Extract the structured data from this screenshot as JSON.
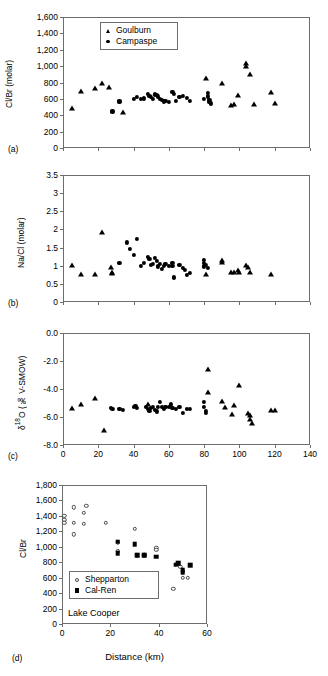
{
  "figure": {
    "width": 328,
    "height": 676,
    "background": "#ffffff",
    "marker_color": "#000000",
    "axis_color": "#6d6d6d"
  },
  "panels": [
    {
      "id": "a",
      "label": "(a)",
      "ylabel": "Cl/Br (molar)",
      "xlabel": "",
      "ylim": [
        0,
        1600
      ],
      "xlim": [
        0,
        140
      ],
      "yticks": [
        "0",
        "200",
        "400",
        "600",
        "800",
        "1,000",
        "1,200",
        "1,400",
        "1,600"
      ],
      "ytick_values": [
        0,
        200,
        400,
        600,
        800,
        1000,
        1200,
        1400,
        1600
      ],
      "xticks": [
        "",
        "",
        "",
        "",
        "",
        "",
        "",
        ""
      ],
      "xtick_values": [
        0,
        20,
        40,
        60,
        80,
        100,
        120,
        140
      ],
      "legend": {
        "position": "top-left",
        "entries": [
          {
            "label": "Goulburn",
            "marker": "triangle-filled"
          },
          {
            "label": "Campaspe",
            "marker": "circle-filled"
          }
        ]
      }
    },
    {
      "id": "b",
      "label": "(b)",
      "ylabel": "Na/Cl (molar)",
      "xlabel": "",
      "ylim": [
        0,
        3.5
      ],
      "xlim": [
        0,
        140
      ],
      "yticks": [
        "0",
        "0.5",
        "1",
        "1.5",
        "2",
        "2.5",
        "3",
        "3.5"
      ],
      "ytick_values": [
        0,
        0.5,
        1,
        1.5,
        2,
        2.5,
        3,
        3.5
      ],
      "xticks": [
        "",
        "",
        "",
        "",
        "",
        "",
        "",
        ""
      ],
      "xtick_values": [
        0,
        20,
        40,
        60,
        80,
        100,
        120,
        140
      ],
      "legend": null
    },
    {
      "id": "c",
      "label": "(c)",
      "ylabel": "δ18O (‰ V-SMOW)",
      "ylabel_parts": {
        "delta": "δ",
        "sup": "18",
        "rest": "O (‰ V-SMOW)"
      },
      "xlabel": "",
      "ylim": [
        -8.0,
        0.0
      ],
      "xlim": [
        0,
        140
      ],
      "yticks": [
        "-8.0",
        "-6.0",
        "-4.0",
        "-2.0",
        "0.0"
      ],
      "ytick_values": [
        -8,
        -6,
        -4,
        -2,
        0
      ],
      "xticks": [
        "0",
        "20",
        "40",
        "60",
        "80",
        "100",
        "120",
        "140"
      ],
      "xtick_values": [
        0,
        20,
        40,
        60,
        80,
        100,
        120,
        140
      ],
      "legend": null
    },
    {
      "id": "d",
      "label": "(d)",
      "ylabel": "Cl/Br",
      "xlabel": "Distance (km)",
      "ylim": [
        0,
        1800
      ],
      "xlim": [
        0,
        60
      ],
      "yticks": [
        "0",
        "200",
        "400",
        "600",
        "800",
        "1,000",
        "1,200",
        "1,400",
        "1,600",
        "1,800"
      ],
      "ytick_values": [
        0,
        200,
        400,
        600,
        800,
        1000,
        1200,
        1400,
        1600,
        1800
      ],
      "xticks": [
        "0",
        "20",
        "40",
        "60"
      ],
      "xtick_values": [
        0,
        20,
        40,
        60
      ],
      "annotation": "Lake Cooper",
      "legend": {
        "position": "lower-left",
        "entries": [
          {
            "label": "Shepparton",
            "marker": "circle-open"
          },
          {
            "label": "Cal-Ren",
            "marker": "square-filled"
          }
        ]
      }
    }
  ],
  "chart_data": [
    {
      "type": "scatter",
      "panel": "a",
      "title": "",
      "xlabel": "",
      "ylabel": "Cl/Br (molar)",
      "xlim": [
        0,
        140
      ],
      "ylim": [
        0,
        1600
      ],
      "grid": false,
      "legend_position": "top-left",
      "series": [
        {
          "name": "Goulburn",
          "marker": "triangle-filled",
          "points": [
            [
              5,
              490
            ],
            [
              10,
              695
            ],
            [
              18,
              730
            ],
            [
              22,
              800
            ],
            [
              26,
              740
            ],
            [
              34,
              435
            ],
            [
              81,
              860
            ],
            [
              90,
              790
            ],
            [
              95,
              520
            ],
            [
              97,
              535
            ],
            [
              99,
              650
            ],
            [
              104,
              1035
            ],
            [
              104,
              1005
            ],
            [
              106,
              905
            ],
            [
              108,
              535
            ],
            [
              118,
              685
            ],
            [
              120,
              555
            ]
          ]
        },
        {
          "name": "Campaspe",
          "marker": "circle-filled",
          "points": [
            [
              28,
              455
            ],
            [
              28,
              440
            ],
            [
              32,
              575
            ],
            [
              32,
              560
            ],
            [
              40,
              600
            ],
            [
              42,
              620
            ],
            [
              44,
              595
            ],
            [
              46,
              605
            ],
            [
              48,
              660
            ],
            [
              49,
              640
            ],
            [
              50,
              620
            ],
            [
              51,
              600
            ],
            [
              52,
              655
            ],
            [
              53,
              645
            ],
            [
              54,
              630
            ],
            [
              55,
              600
            ],
            [
              56,
              590
            ],
            [
              57,
              570
            ],
            [
              58,
              575
            ],
            [
              60,
              560
            ],
            [
              62,
              690
            ],
            [
              63,
              660
            ],
            [
              64,
              580
            ],
            [
              66,
              620
            ],
            [
              68,
              635
            ],
            [
              70,
              610
            ],
            [
              72,
              575
            ],
            [
              80,
              600
            ],
            [
              82,
              670
            ],
            [
              82,
              630
            ],
            [
              83,
              590
            ],
            [
              83,
              560
            ],
            [
              84,
              545
            ]
          ]
        }
      ]
    },
    {
      "type": "scatter",
      "panel": "b",
      "title": "",
      "xlabel": "",
      "ylabel": "Na/Cl (molar)",
      "xlim": [
        0,
        140
      ],
      "ylim": [
        0,
        3.5
      ],
      "grid": false,
      "series": [
        {
          "name": "Goulburn",
          "marker": "triangle-filled",
          "points": [
            [
              5,
              1.02
            ],
            [
              10,
              0.78
            ],
            [
              18,
              0.76
            ],
            [
              22,
              1.94
            ],
            [
              27,
              0.97
            ],
            [
              28,
              0.84
            ],
            [
              28,
              0.79
            ],
            [
              81,
              0.77
            ],
            [
              90,
              1.15
            ],
            [
              90,
              1.11
            ],
            [
              95,
              0.83
            ],
            [
              97,
              0.84
            ],
            [
              99,
              0.87
            ],
            [
              100,
              0.84
            ],
            [
              104,
              1.02
            ],
            [
              105,
              0.97
            ],
            [
              106,
              0.82
            ],
            [
              118,
              0.78
            ]
          ]
        },
        {
          "name": "Campaspe",
          "marker": "circle-filled",
          "points": [
            [
              32,
              1.08
            ],
            [
              36,
              1.64
            ],
            [
              38,
              1.46
            ],
            [
              40,
              1.3
            ],
            [
              42,
              1.75
            ],
            [
              44,
              1.0
            ],
            [
              46,
              1.07
            ],
            [
              48,
              1.25
            ],
            [
              49,
              1.18
            ],
            [
              50,
              1.02
            ],
            [
              51,
              1.06
            ],
            [
              52,
              1.22
            ],
            [
              53,
              1.13
            ],
            [
              54,
              0.98
            ],
            [
              55,
              1.05
            ],
            [
              56,
              0.92
            ],
            [
              57,
              1.0
            ],
            [
              58,
              1.04
            ],
            [
              60,
              0.99
            ],
            [
              62,
              1.08
            ],
            [
              62,
              1.0
            ],
            [
              63,
              0.7
            ],
            [
              63,
              0.66
            ],
            [
              66,
              1.02
            ],
            [
              68,
              0.93
            ],
            [
              69,
              0.88
            ],
            [
              70,
              0.74
            ],
            [
              72,
              0.8
            ],
            [
              80,
              1.17
            ],
            [
              80,
              1.07
            ],
            [
              80,
              0.98
            ],
            [
              81,
              1.02
            ],
            [
              82,
              0.95
            ]
          ]
        }
      ]
    },
    {
      "type": "scatter",
      "panel": "c",
      "title": "",
      "xlabel": "",
      "ylabel": "δ18O (‰ V-SMOW)",
      "xlim": [
        0,
        140
      ],
      "ylim": [
        -8.0,
        0.0
      ],
      "grid": false,
      "series": [
        {
          "name": "Goulburn",
          "marker": "triangle-filled",
          "points": [
            [
              5,
              -5.35
            ],
            [
              10,
              -5.1
            ],
            [
              18,
              -4.65
            ],
            [
              23,
              -6.9
            ],
            [
              48,
              -5.05
            ],
            [
              82,
              -2.6
            ],
            [
              82,
              -4.18
            ],
            [
              90,
              -4.85
            ],
            [
              92,
              -5.3
            ],
            [
              96,
              -5.8
            ],
            [
              97,
              -5.15
            ],
            [
              100,
              -3.7
            ],
            [
              105,
              -5.7
            ],
            [
              106,
              -5.85
            ],
            [
              106,
              -6.15
            ],
            [
              107,
              -6.45
            ],
            [
              118,
              -5.5
            ],
            [
              120,
              -5.5
            ]
          ]
        },
        {
          "name": "Campaspe",
          "marker": "circle-filled",
          "points": [
            [
              27,
              -5.35
            ],
            [
              28,
              -5.4
            ],
            [
              32,
              -5.45
            ],
            [
              34,
              -5.5
            ],
            [
              40,
              -5.25
            ],
            [
              41,
              -5.2
            ],
            [
              42,
              -5.35
            ],
            [
              47,
              -5.3
            ],
            [
              48,
              -5.45
            ],
            [
              49,
              -5.55
            ],
            [
              50,
              -5.35
            ],
            [
              51,
              -5.25
            ],
            [
              52,
              -5.5
            ],
            [
              53,
              -5.6
            ],
            [
              54,
              -5.3
            ],
            [
              55,
              -4.95
            ],
            [
              56,
              -5.25
            ],
            [
              57,
              -5.4
            ],
            [
              58,
              -5.3
            ],
            [
              60,
              -5.25
            ],
            [
              61,
              -5.1
            ],
            [
              62,
              -5.35
            ],
            [
              64,
              -5.45
            ],
            [
              66,
              -5.3
            ],
            [
              68,
              -5.7
            ],
            [
              70,
              -5.4
            ],
            [
              72,
              -5.45
            ],
            [
              80,
              -4.95
            ],
            [
              80,
              -5.25
            ],
            [
              81,
              -5.55
            ],
            [
              81,
              -5.7
            ]
          ]
        }
      ]
    },
    {
      "type": "scatter",
      "panel": "d",
      "title": "",
      "xlabel": "Distance (km)",
      "ylabel": "Cl/Br",
      "xlim": [
        0,
        60
      ],
      "ylim": [
        0,
        1800
      ],
      "grid": false,
      "annotation": "Lake Cooper",
      "legend_position": "lower-left",
      "series": [
        {
          "name": "Shepparton",
          "marker": "circle-open",
          "points": [
            [
              1,
              1400
            ],
            [
              1,
              1350
            ],
            [
              1,
              1310
            ],
            [
              5,
              1510
            ],
            [
              5,
              1310
            ],
            [
              5,
              1160
            ],
            [
              9,
              1440
            ],
            [
              9,
              1300
            ],
            [
              10,
              1530
            ],
            [
              18,
              1310
            ],
            [
              23,
              1060
            ],
            [
              23,
              940
            ],
            [
              30,
              1230
            ],
            [
              31,
              890
            ],
            [
              34,
              900
            ],
            [
              34,
              890
            ],
            [
              39,
              990
            ],
            [
              39,
              960
            ],
            [
              46,
              455
            ],
            [
              48,
              780
            ],
            [
              49,
              740
            ],
            [
              50,
              690
            ],
            [
              50,
              600
            ],
            [
              52,
              595
            ]
          ]
        },
        {
          "name": "Cal-Ren",
          "marker": "square-filled",
          "points": [
            [
              23,
              1065
            ],
            [
              23,
              920
            ],
            [
              30,
              1030
            ],
            [
              31,
              890
            ],
            [
              34,
              890
            ],
            [
              39,
              870
            ],
            [
              47,
              770
            ],
            [
              48,
              790
            ],
            [
              50,
              700
            ],
            [
              50,
              665
            ],
            [
              53,
              760
            ]
          ]
        }
      ]
    }
  ]
}
